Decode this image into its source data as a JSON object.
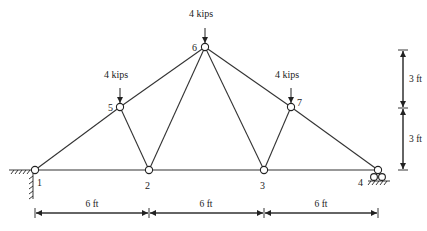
{
  "diagram": {
    "type": "truss",
    "nodes": [
      {
        "id": "1",
        "label": "1",
        "x": 35,
        "y": 170,
        "lx": 37,
        "ly": 186
      },
      {
        "id": "2",
        "label": "2",
        "x": 149,
        "y": 170,
        "lx": 145,
        "ly": 189
      },
      {
        "id": "3",
        "label": "3",
        "x": 264,
        "y": 170,
        "lx": 260,
        "ly": 189
      },
      {
        "id": "4",
        "label": "4",
        "x": 378,
        "y": 170,
        "lx": 358,
        "ly": 186
      },
      {
        "id": "5",
        "label": "5",
        "x": 120,
        "y": 107,
        "lx": 108,
        "ly": 111
      },
      {
        "id": "6",
        "label": "6",
        "x": 205,
        "y": 47,
        "lx": 192,
        "ly": 51
      },
      {
        "id": "7",
        "label": "7",
        "x": 291,
        "y": 107,
        "lx": 297,
        "ly": 106
      }
    ],
    "members": [
      [
        "1",
        "2"
      ],
      [
        "2",
        "3"
      ],
      [
        "3",
        "4"
      ],
      [
        "1",
        "5"
      ],
      [
        "5",
        "6"
      ],
      [
        "6",
        "7"
      ],
      [
        "7",
        "4"
      ],
      [
        "5",
        "2"
      ],
      [
        "2",
        "6"
      ],
      [
        "6",
        "3"
      ],
      [
        "3",
        "7"
      ]
    ],
    "loads": [
      {
        "node": "5",
        "label": "4 kips",
        "x": 120,
        "y_top": 88,
        "lx": 104,
        "ly": 78
      },
      {
        "node": "6",
        "label": "4 kips",
        "x": 205,
        "y_top": 28,
        "lx": 189,
        "ly": 17
      },
      {
        "node": "7",
        "label": "4 kips",
        "x": 291,
        "y_top": 88,
        "lx": 275,
        "ly": 78
      }
    ],
    "supports": [
      {
        "node": "1",
        "type": "pin-wall"
      },
      {
        "node": "4",
        "type": "roller"
      }
    ],
    "dimensions": {
      "horizontal": {
        "y": 213,
        "ticks": [
          35,
          149,
          264,
          378
        ],
        "labels": [
          {
            "text": "6 ft",
            "x": 92
          },
          {
            "text": "6 ft",
            "x": 206
          },
          {
            "text": "6 ft",
            "x": 321
          }
        ],
        "label_y": 207
      },
      "vertical": {
        "x": 403,
        "ticks": [
          50,
          108,
          170
        ],
        "labels": [
          {
            "text": "3 ft",
            "y": 82
          },
          {
            "text": "3 ft",
            "y": 142
          }
        ],
        "label_x": 409
      }
    }
  }
}
